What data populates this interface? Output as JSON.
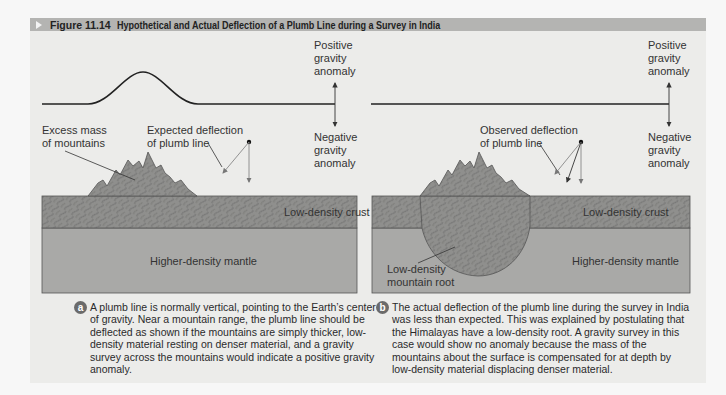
{
  "header": {
    "figure_label": "Figure 11.14",
    "title": "Hypothetical and Actual Deflection of a Plumb Line during a Survey in India"
  },
  "panel_a": {
    "gravity_positive": [
      "Positive",
      "gravity",
      "anomaly"
    ],
    "gravity_negative": [
      "Negative",
      "gravity",
      "anomaly"
    ],
    "excess_mass_label": [
      "Excess mass",
      "of mountains"
    ],
    "deflection_label": [
      "Expected deflection",
      "of plumb line"
    ],
    "crust_label": "Low-density crust",
    "mantle_label": "Higher-density mantle",
    "badge": "a",
    "caption": "A plumb line is normally vertical, pointing to the Earth’s center of gravity. Near a mountain range, the plumb line should be deflected as shown if the mountains are simply thicker, low-density material resting on denser material, and a gravity survey across the mountains would indicate a positive gravity anomaly."
  },
  "panel_b": {
    "gravity_positive": [
      "Positive",
      "gravity",
      "anomaly"
    ],
    "gravity_negative": [
      "Negative",
      "gravity",
      "anomaly"
    ],
    "deflection_label": [
      "Observed deflection",
      "of plumb line"
    ],
    "crust_label": "Low-density crust",
    "mantle_label": "Higher-density mantle",
    "root_label": [
      "Low-density",
      "mountain root"
    ],
    "badge": "b",
    "caption": "The actual deflection of the plumb line during the survey in India was less than expected. This was explained by postulating that the Himalayas have a low-density root. A gravity survey in this case would show no anomaly because the mass of the mountains about the surface is compensated for at depth by low-density material displacing denser material."
  },
  "colors": {
    "header_bg": "#b4b4b2",
    "panel_bg": "#ececea",
    "crust": "#8f8f8d",
    "mantle": "#a9a9a7",
    "badge": "#6b6b6b"
  }
}
